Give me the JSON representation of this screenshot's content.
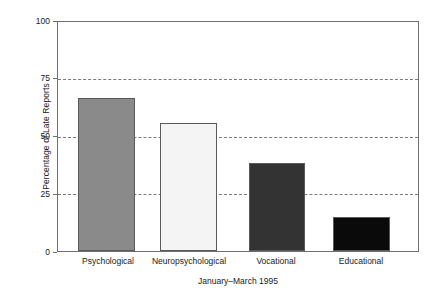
{
  "chart_data": {
    "type": "bar",
    "title": "",
    "subtitle": "",
    "xlabel": "January–March 1995",
    "ylabel": "Percentage of Late Reports",
    "categories": [
      "Psychological",
      "Neuropsychological",
      "Vocational",
      "Educational"
    ],
    "values": [
      67,
      56,
      38.5,
      15
    ],
    "series": [
      {
        "name": "Percentage of Late Reports",
        "values": [
          67,
          56,
          38.5,
          15
        ]
      }
    ],
    "ylim": [
      0,
      100
    ],
    "yticks": [
      0,
      25,
      50,
      75,
      100
    ],
    "ytick_labels": [
      "0",
      "25",
      "50",
      "75",
      "100"
    ],
    "grid": "horizontal-dashed-at-25-50-75",
    "legend": "none",
    "bar_colors": [
      "#8a8a8a",
      "#f4f4f4",
      "#333333",
      "#0a0a0a"
    ],
    "bar_edge_color": "#5a5a5a",
    "frame_color": "#6f6f6f",
    "gridline_color": "#7a7a7a",
    "background_color": "#ffffff",
    "annotations": []
  },
  "axes": {
    "y_title": "Percentage of Late Reports",
    "x_title": "January–March 1995",
    "y_tick_0": "0",
    "y_tick_25": "25",
    "y_tick_50": "50",
    "y_tick_75": "75",
    "y_tick_100": "100"
  },
  "bars": [
    {
      "label": "Psychological",
      "value": 67,
      "color": "#8a8a8a"
    },
    {
      "label": "Neuropsychological",
      "value": 56,
      "color": "#f4f4f4"
    },
    {
      "label": "Vocational",
      "value": 38.5,
      "color": "#333333"
    },
    {
      "label": "Educational",
      "value": 15,
      "color": "#0a0a0a"
    }
  ]
}
